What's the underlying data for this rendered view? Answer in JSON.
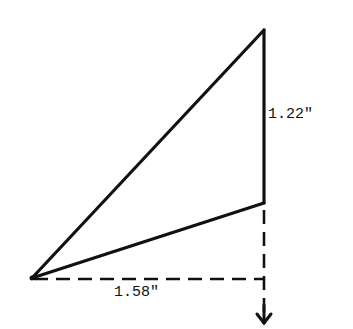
{
  "diagram": {
    "type": "triangle-with-dimensions",
    "vertices": {
      "left": [
        32,
        278
      ],
      "top": [
        264,
        30
      ],
      "lower_right": [
        264,
        203
      ]
    },
    "labels": {
      "vertical": "1.22\"",
      "horizontal": "1.58\""
    },
    "colors": {
      "stroke": "#111111",
      "background": "#ffffff"
    }
  }
}
